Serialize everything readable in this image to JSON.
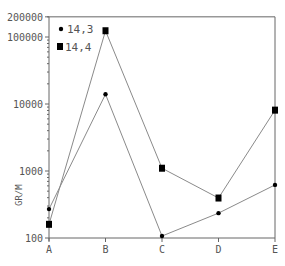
{
  "chart_data": {
    "type": "line",
    "title": "",
    "xlabel": "",
    "ylabel": "GR/M",
    "yscale": "log",
    "ylim": [
      100,
      200000
    ],
    "yticks": [
      100,
      1000,
      10000,
      100000,
      200000
    ],
    "ytick_labels": [
      "100",
      "1000",
      "10000",
      "100000",
      "200000"
    ],
    "categories": [
      "A",
      "B",
      "C",
      "D",
      "E"
    ],
    "series": [
      {
        "name": "14,3",
        "marker": "circle",
        "values": [
          270,
          14000,
          107,
          235,
          620
        ]
      },
      {
        "name": "14,4",
        "marker": "square",
        "values": [
          160,
          124000,
          1100,
          395,
          8100
        ]
      }
    ],
    "legend_position": "upper-left-inside",
    "grid": false
  },
  "colors": {
    "line": "#8a8a8a",
    "marker": "#000000",
    "axis": "#666666",
    "text": "#555555"
  }
}
